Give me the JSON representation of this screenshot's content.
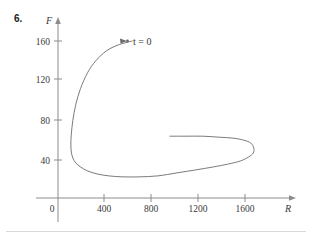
{
  "problem": {
    "number": "6."
  },
  "chart_data": {
    "type": "line",
    "title": "",
    "subtitle": "",
    "xlabel": "R",
    "ylabel": "F",
    "xlim": [
      0,
      2000
    ],
    "ylim": [
      0,
      180
    ],
    "grid": false,
    "legend": null,
    "x_ticks": [
      "0",
      "400",
      "800",
      "1200",
      "1600"
    ],
    "x_tick_values": [
      0,
      400,
      800,
      1200,
      1600
    ],
    "y_ticks": [
      "40",
      "80",
      "120",
      "160"
    ],
    "y_tick_values": [
      40,
      80,
      120,
      160
    ],
    "annotations": [
      {
        "text": "t = 0",
        "x": 640,
        "y": 160,
        "marker": "dot-with-arrow"
      }
    ],
    "series": [
      {
        "name": "phase-trajectory",
        "comment": "Inward predator-prey spiral traversed from the start point t = 0 at (640, 160) counter-clockwise toward the interior.",
        "points": [
          [
            640,
            160
          ],
          [
            520,
            156
          ],
          [
            420,
            150
          ],
          [
            330,
            140
          ],
          [
            260,
            128
          ],
          [
            200,
            112
          ],
          [
            160,
            96
          ],
          [
            135,
            80
          ],
          [
            122,
            66
          ],
          [
            118,
            56
          ],
          [
            122,
            48
          ],
          [
            135,
            42
          ],
          [
            160,
            37
          ],
          [
            200,
            33
          ],
          [
            260,
            29
          ],
          [
            340,
            26
          ],
          [
            440,
            24
          ],
          [
            560,
            23
          ],
          [
            700,
            23
          ],
          [
            860,
            24
          ],
          [
            1020,
            27
          ],
          [
            1180,
            30
          ],
          [
            1330,
            33
          ],
          [
            1460,
            36
          ],
          [
            1560,
            39
          ],
          [
            1630,
            43
          ],
          [
            1670,
            47
          ],
          [
            1675,
            52
          ],
          [
            1650,
            57
          ],
          [
            1590,
            60
          ],
          [
            1500,
            62
          ],
          [
            1380,
            63
          ],
          [
            1240,
            64
          ],
          [
            1090,
            64
          ],
          [
            960,
            64
          ]
        ]
      }
    ]
  }
}
